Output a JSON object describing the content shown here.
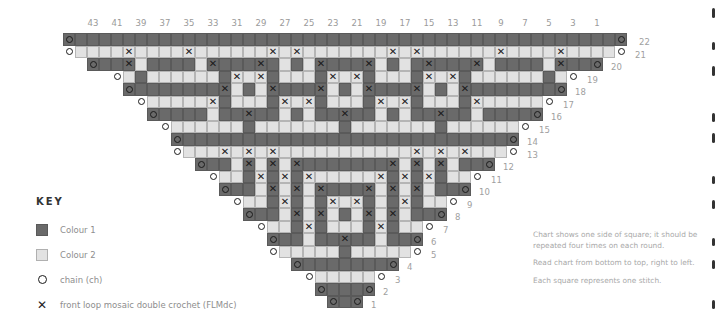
{
  "chart": {
    "colors": {
      "colour1": "#6a6a6a",
      "colour2": "#e2e2e2",
      "symbol": "#1a1a1a"
    },
    "column_labels": [
      "43",
      "41",
      "39",
      "37",
      "35",
      "33",
      "31",
      "29",
      "27",
      "25",
      "23",
      "21",
      "19",
      "17",
      "15",
      "13",
      "11",
      "9",
      "7",
      "5",
      "3",
      "1"
    ],
    "row_legend": "codes: c=chain, d=Colour 1, l=Colour 2, x=FLMdc on Colour 1, y=FLMdc on Colour 2; left half from row start to centre column, mirrored",
    "rows": [
      {
        "n": "22",
        "cells": "cddddddddddddddddddddddd"
      },
      {
        "n": "21",
        "cells": "cllllyllllyllllllylyllll"
      },
      {
        "n": "20",
        "cells": "cddxlddddlxdddxdldlxdd"
      },
      {
        "n": "19",
        "cells": "cldlllllldylydllldyl"
      },
      {
        "n": "18",
        "cells": "cdddddddxldlxdddxld"
      },
      {
        "n": "17",
        "cells": "clllllydllldylydll"
      },
      {
        "n": "16",
        "cells": "cddddlddxddldlddx"
      },
      {
        "n": "15",
        "cells": "clllllldllllllld"
      },
      {
        "n": "14",
        "cells": "cdddddddddddddd"
      },
      {
        "n": "13",
        "cells": "clllylylyllllll"
      },
      {
        "n": "12",
        "cells": "cddlxlxlxdddd"
      },
      {
        "n": "11",
        "cells": "clldydydylll"
      },
      {
        "n": "10",
        "cells": "cddlxlxlxdd"
      },
      {
        "n": "9",
        "cells": "clldydldyl"
      },
      {
        "n": "8",
        "cells": "cddlxlxld"
      },
      {
        "n": "7",
        "cells": "clldydll"
      },
      {
        "n": "6",
        "cells": "cddlddx"
      },
      {
        "n": "5",
        "cells": "cllllld"
      },
      {
        "n": "4",
        "cells": "cdddd"
      },
      {
        "n": "3",
        "cells": "clll"
      },
      {
        "n": "2",
        "cells": "cdd"
      },
      {
        "n": "1",
        "cells": "cd"
      }
    ]
  },
  "key": {
    "title": "KEY",
    "items": [
      {
        "symbol": "colour1-swatch",
        "label": "Colour 1"
      },
      {
        "symbol": "colour2-swatch",
        "label": "Colour 2"
      },
      {
        "symbol": "circle-icon",
        "label": "chain (ch)"
      },
      {
        "symbol": "cross-icon",
        "label": "front loop mosaic double crochet (FLMdc)"
      }
    ]
  },
  "notes": [
    "Chart shows one side of square; it should be repeated four times on each round.",
    "Read chart from bottom to top, right to left.",
    "Each square represents one stitch."
  ]
}
